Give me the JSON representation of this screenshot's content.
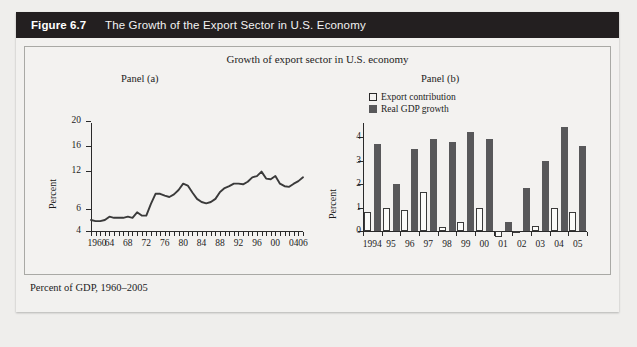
{
  "figure": {
    "number": "Figure 6.7",
    "title": "The Growth of the Export Sector in U.S. Economy",
    "supertitle": "Growth of export sector in U.S. economy",
    "caption": "Percent of GDP, 1960–2005",
    "panel_a_label": "Panel (a)",
    "panel_b_label": "Panel (b)"
  },
  "legend": {
    "export_label": "Export contribution",
    "gdp_label": "Real GDP growth"
  },
  "colors": {
    "header_bg": "#231f20",
    "header_text": "#ffffff",
    "panel_bg": "#f3f2f0",
    "gdp_bar": "#58585a",
    "export_bar": "#fbfbf9",
    "axis": "#2a2a2a"
  },
  "chart_data": [
    {
      "type": "line",
      "title": "Panel (a)",
      "subtitle": "Growth of export sector in U.S. economy",
      "xlabel": "",
      "ylabel": "Percent",
      "caption": "Percent of GDP, 1960–2005",
      "ylim": [
        4,
        20
      ],
      "yticks": [
        4,
        6,
        12,
        16,
        20
      ],
      "ytick_labels": [
        "4",
        "6",
        "12",
        "16",
        "20"
      ],
      "xlim": [
        1960,
        2006
      ],
      "xtick_labels": [
        "1960",
        "64",
        "68",
        "72",
        "76",
        "80",
        "84",
        "88",
        "92",
        "96",
        "00",
        "04",
        "06"
      ],
      "xtick_values": [
        1960,
        1964,
        1968,
        1972,
        1976,
        1980,
        1984,
        1988,
        1992,
        1996,
        2000,
        2004,
        2006
      ],
      "grid": false,
      "legend_position": "none",
      "x": [
        1960,
        1961,
        1962,
        1963,
        1964,
        1965,
        1966,
        1967,
        1968,
        1969,
        1970,
        1971,
        1972,
        1973,
        1974,
        1975,
        1976,
        1977,
        1978,
        1979,
        1980,
        1981,
        1982,
        1983,
        1984,
        1985,
        1986,
        1987,
        1988,
        1989,
        1990,
        1991,
        1992,
        1993,
        1994,
        1995,
        1996,
        1997,
        1998,
        1999,
        2000,
        2001,
        2002,
        2003,
        2004,
        2005,
        2006
      ],
      "values": [
        5.0,
        4.9,
        4.9,
        5.0,
        5.3,
        5.2,
        5.2,
        5.2,
        5.3,
        5.2,
        5.7,
        5.4,
        5.4,
        6.8,
        8.4,
        8.4,
        8.1,
        7.9,
        8.3,
        9.0,
        10.0,
        9.7,
        8.6,
        7.6,
        7.1,
        6.9,
        7.1,
        7.6,
        8.7,
        9.3,
        9.6,
        10.0,
        10.0,
        9.9,
        10.3,
        11.0,
        11.2,
        11.9,
        10.8,
        10.7,
        11.2,
        10.0,
        9.6,
        9.5,
        10.0,
        10.4,
        11.0
      ],
      "series_name": "Exports as percent of GDP"
    },
    {
      "type": "bar",
      "title": "Panel (b)",
      "xlabel": "",
      "ylabel": "Percent",
      "ylim": [
        -0.4,
        4.6
      ],
      "yticks": [
        0,
        1,
        2,
        3,
        4
      ],
      "ytick_labels": [
        "0",
        "1",
        "2",
        "3",
        "4"
      ],
      "grid": false,
      "legend_position": "top-left",
      "categories": [
        "1994",
        "95",
        "96",
        "97",
        "98",
        "99",
        "00",
        "01",
        "02",
        "03",
        "04",
        "05"
      ],
      "series": [
        {
          "name": "Export contribution",
          "values": [
            0.8,
            1.0,
            0.9,
            1.67,
            0.17,
            0.4,
            1.0,
            -0.25,
            -0.1,
            0.2,
            1.0,
            0.82
          ]
        },
        {
          "name": "Real GDP growth",
          "values": [
            3.7,
            2.0,
            3.5,
            3.9,
            3.8,
            4.2,
            3.9,
            0.4,
            1.85,
            3.0,
            4.45,
            3.6
          ]
        }
      ]
    }
  ]
}
